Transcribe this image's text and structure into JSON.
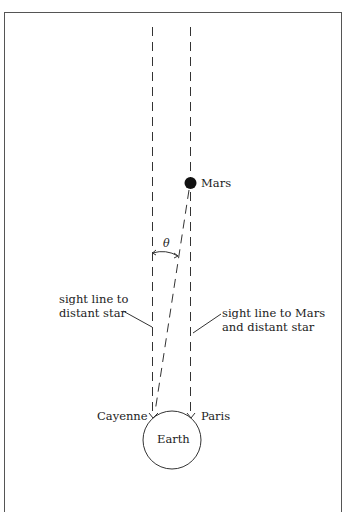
{
  "figure": {
    "labels": {
      "mars": "Mars",
      "theta": "θ",
      "left_sight_line": [
        "sight line to",
        "distant star"
      ],
      "right_sight_line": [
        "sight line to Mars",
        "and distant star"
      ],
      "cayenne": "Cayenne",
      "paris": "Paris",
      "earth": "Earth"
    },
    "colors": {
      "line": "#333333",
      "mars_fill": "#111111",
      "border": "#555555"
    }
  }
}
